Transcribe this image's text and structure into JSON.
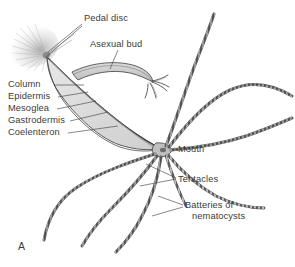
{
  "figure": {
    "panel_letter": "A",
    "organism": "hydra",
    "background_color": "#ffffff",
    "ink_color": "#3b3b3b",
    "body_fill_color": "#dcdcdc",
    "tentacle_color": "#6e6e6e"
  },
  "labels": {
    "pedal_disc": {
      "text": "Pedal disc",
      "x": 84,
      "y": 18
    },
    "asexual_bud": {
      "text": "Asexual bud",
      "x": 90,
      "y": 44
    },
    "column": {
      "text": "Column",
      "x": 8,
      "y": 88
    },
    "epidermis": {
      "text": "Epidermis",
      "x": 8,
      "y": 100
    },
    "mesoglea": {
      "text": "Mesoglea",
      "x": 8,
      "y": 112
    },
    "gastrodermis": {
      "text": "Gastrodermis",
      "x": 8,
      "y": 124
    },
    "coelenteron": {
      "text": "Coelenteron",
      "x": 8,
      "y": 136
    },
    "mouth": {
      "text": "Mouth",
      "x": 178,
      "y": 150
    },
    "tentacles": {
      "text": "Tentacles",
      "x": 178,
      "y": 180
    },
    "batteries_line1": {
      "text": "Batteries of",
      "x": 185,
      "y": 206
    },
    "batteries_line2": {
      "text": "nematocysts"
    }
  }
}
